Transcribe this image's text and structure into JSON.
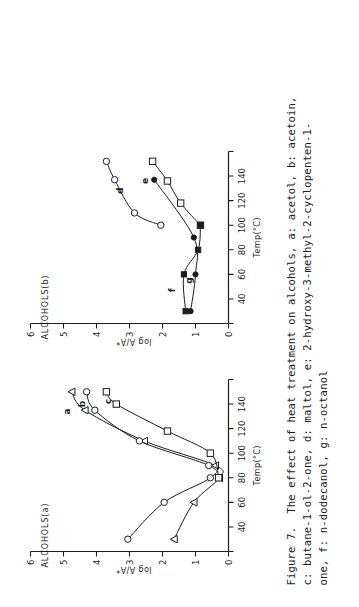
{
  "figure": {
    "caption_lines": [
      "Figure 7.  The effect of heat treatment on alcohols, a: acetol, b: acetoin,",
      "c: butane-1-ol-2-one, d: maltol, e: 2-hydroxy-3-methyl-2-cyclopenten-1-",
      "one, f: n-dodecanol, g: n-octanol"
    ],
    "caption_full": "Figure 7. The effect of heat treatment on alcohols, a: acetol, b: acetoin, c: butane-1-ol-2-one, d: maltol, e: 2-hydroxy-3-methyl-2-cyclopenten-1-one, f: n-dodecanol, g: n-octanol",
    "ink_color": "#1c1c1c",
    "paper_color": "#ffffff"
  },
  "chart_data": [
    {
      "type": "line",
      "panel_id": "a",
      "title": "ALCOHOLS(a)",
      "xlabel": "Temp(°C)",
      "ylabel": "log A/A*",
      "xlim": [
        20,
        160
      ],
      "ylim": [
        0,
        6
      ],
      "xticks": [
        20,
        40,
        60,
        80,
        100,
        120,
        140,
        160
      ],
      "xticklabels": [
        "",
        "40",
        "60",
        "80",
        "100",
        "120",
        "140",
        ""
      ],
      "yticks": [
        0,
        1,
        2,
        3,
        4,
        5,
        6
      ],
      "yticklabels": [
        "0",
        "1",
        "2",
        "3",
        "4",
        "5",
        "6"
      ],
      "grid": false,
      "legend": "inline-curve-labels",
      "series": [
        {
          "name": "a",
          "label": "a",
          "compound": "acetol",
          "marker": "triangle-open",
          "x": [
            30,
            60,
            80,
            90,
            110,
            135,
            150
          ],
          "y": [
            1.65,
            1.05,
            0.28,
            0.4,
            2.55,
            4.35,
            4.75
          ]
        },
        {
          "name": "b",
          "label": "b",
          "compound": "acetoin",
          "marker": "circle-open",
          "x": [
            30,
            60,
            80,
            90,
            110,
            135,
            150
          ],
          "y": [
            3.05,
            1.95,
            0.55,
            0.6,
            2.7,
            4.05,
            4.3
          ]
        },
        {
          "name": "c",
          "label": "c",
          "compound": "butane-1-ol-2-one",
          "marker": "square-open",
          "x": [
            80,
            100,
            118,
            140,
            150
          ],
          "y": [
            0.3,
            0.55,
            1.85,
            3.4,
            3.7
          ]
        }
      ],
      "curve_labels": [
        {
          "text": "a",
          "x": 134,
          "y": 4.8
        },
        {
          "text": "b",
          "x": 140,
          "y": 4.35
        },
        {
          "text": "c",
          "x": 142,
          "y": 3.55
        }
      ]
    },
    {
      "type": "line",
      "panel_id": "b",
      "title": "ALCOHOLS(b)",
      "xlabel": "Temp(°C)",
      "ylabel": "log A/A*",
      "xlim": [
        20,
        160
      ],
      "ylim": [
        0,
        6
      ],
      "xticks": [
        20,
        40,
        60,
        80,
        100,
        120,
        140,
        160
      ],
      "xticklabels": [
        "",
        "40",
        "60",
        "80",
        "100",
        "120",
        "140",
        ""
      ],
      "yticks": [
        0,
        1,
        2,
        3,
        4,
        5,
        6
      ],
      "yticklabels": [
        "0",
        "1",
        "2",
        "3",
        "4",
        "5",
        "6"
      ],
      "grid": false,
      "legend": "inline-curve-labels",
      "series": [
        {
          "name": "d",
          "label": "d",
          "compound": "maltol",
          "marker": "circle-open",
          "x": [
            100,
            110,
            137,
            152
          ],
          "y": [
            2.05,
            2.85,
            3.45,
            3.7
          ]
        },
        {
          "name": "e",
          "label": "e",
          "compound": "2-hydroxy-3-methyl-2-cyclopenten-1-one",
          "marker": "square-open",
          "x": [
            100,
            118,
            136,
            152
          ],
          "y": [
            0.85,
            1.45,
            1.85,
            2.3
          ]
        },
        {
          "name": "f",
          "label": "f",
          "compound": "n-dodecanol",
          "marker": "square-filled",
          "x": [
            30,
            60,
            80,
            100
          ],
          "y": [
            1.3,
            1.35,
            0.92,
            0.85
          ]
        },
        {
          "name": "g",
          "label": "g",
          "compound": "n-octanol",
          "marker": "circle-filled",
          "x": [
            30,
            60,
            90,
            137
          ],
          "y": [
            1.15,
            1.0,
            1.05,
            2.25
          ]
        }
      ],
      "curve_labels": [
        {
          "text": "d",
          "x": 128,
          "y": 3.2
        },
        {
          "text": "e",
          "x": 136,
          "y": 2.45
        },
        {
          "text": "f",
          "x": 47,
          "y": 1.62
        },
        {
          "text": "g",
          "x": 55,
          "y": 1.1
        }
      ]
    }
  ]
}
